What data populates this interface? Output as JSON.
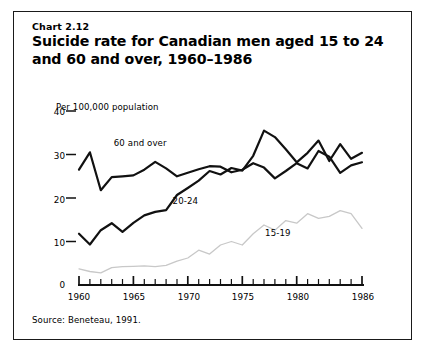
{
  "figure": {
    "chart_number": "Chart 2.12",
    "title": "Suicide rate for Canadian men aged 15 to 24 and 60 and over, 1960–1986",
    "source_note": "Source: Beneteau, 1991.",
    "unit_label": "Per 100,000 population",
    "frame_color": "#1a1a1a"
  },
  "chart_data": {
    "type": "line",
    "title": "Suicide rate for Canadian men aged 15 to 24 and 60 and over, 1960–1986",
    "xlabel": "",
    "ylabel": "Per 100,000 population",
    "xlim": [
      1960,
      1986
    ],
    "ylim": [
      0,
      40
    ],
    "ytick_labels": [
      "0",
      "10",
      "20",
      "30",
      "40"
    ],
    "yticks": [
      0,
      10,
      20,
      30,
      40
    ],
    "xtick_labels": [
      "1960",
      "1965",
      "1970",
      "1975",
      "1980",
      "1986"
    ],
    "xticks_labeled": [
      1960,
      1965,
      1970,
      1975,
      1980,
      1986
    ],
    "xticks_all": [
      1960,
      1961,
      1962,
      1963,
      1964,
      1965,
      1966,
      1967,
      1968,
      1969,
      1970,
      1971,
      1972,
      1973,
      1974,
      1975,
      1976,
      1977,
      1978,
      1979,
      1980,
      1981,
      1982,
      1983,
      1984,
      1985,
      1986
    ],
    "grid": false,
    "legend_position": "inline-annotations",
    "x": [
      1960,
      1961,
      1962,
      1963,
      1964,
      1965,
      1966,
      1967,
      1968,
      1969,
      1970,
      1971,
      1972,
      1973,
      1974,
      1975,
      1976,
      1977,
      1978,
      1979,
      1980,
      1981,
      1982,
      1983,
      1984,
      1985,
      1986
    ],
    "series": [
      {
        "name": "60 and over",
        "color": "#111111",
        "style": "solid-thick",
        "label_x": 1963.2,
        "label_y": 32.5,
        "values": [
          26.5,
          30.5,
          21.8,
          24.8,
          25.0,
          25.2,
          26.5,
          28.3,
          26.8,
          25.0,
          25.8,
          26.6,
          27.3,
          27.2,
          25.9,
          26.5,
          28.0,
          27.0,
          24.5,
          26.2,
          28.0,
          26.8,
          30.8,
          29.5,
          25.8,
          27.5,
          28.2
        ]
      },
      {
        "name": "20-24",
        "color": "#111111",
        "style": "solid-thick",
        "label_x": 1968.6,
        "label_y": 19.0,
        "values": [
          11.8,
          9.3,
          12.6,
          14.2,
          12.2,
          14.3,
          16.0,
          16.8,
          17.2,
          20.7,
          22.3,
          24.0,
          26.2,
          25.4,
          26.9,
          26.3,
          29.7,
          35.5,
          34.0,
          31.2,
          28.2,
          30.4,
          33.2,
          28.5,
          32.4,
          29.0,
          30.4
        ]
      },
      {
        "name": "15-19",
        "color": "#c8c8c8",
        "style": "solid-light",
        "label_x": 1977.1,
        "label_y": 11.8,
        "values": [
          3.7,
          3.1,
          2.8,
          4.0,
          4.2,
          4.3,
          4.4,
          4.2,
          4.5,
          5.5,
          6.2,
          8.0,
          7.1,
          9.2,
          10.0,
          9.2,
          11.8,
          13.8,
          12.6,
          14.8,
          14.2,
          16.4,
          15.3,
          15.8,
          17.1,
          16.4,
          13.0
        ]
      }
    ]
  }
}
